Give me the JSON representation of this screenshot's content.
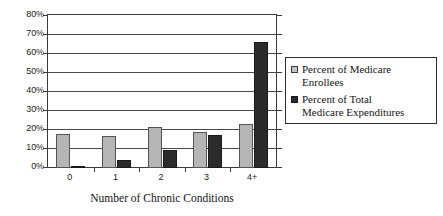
{
  "chart_data": {
    "type": "bar",
    "title": "",
    "xlabel": "Number of Chronic Conditions",
    "ylabel": "",
    "categories": [
      "0",
      "1",
      "2",
      "3",
      "4+"
    ],
    "ylim": [
      0,
      80
    ],
    "yticks": [
      "0%",
      "10%",
      "20%",
      "30%",
      "40%",
      "50%",
      "60%",
      "70%",
      "80%"
    ],
    "ytick_values": [
      0,
      10,
      20,
      30,
      40,
      50,
      60,
      70,
      80
    ],
    "grid": true,
    "legend_position": "right",
    "series": [
      {
        "name": "Percent of Medicare Enrollees",
        "color": "#b5b5b5",
        "values": [
          18,
          17,
          21.5,
          19,
          23.5
        ]
      },
      {
        "name": "Percent of Total Medicare Expenditures",
        "color": "#2b2b2b",
        "values": [
          1.3,
          4,
          9.5,
          17.5,
          66.5
        ]
      }
    ]
  },
  "legend": {
    "entries": [
      {
        "label_line1": "Percent of Medicare",
        "label_line2": "Enrollees",
        "swatch": "light-gray-square"
      },
      {
        "label_line1": "Percent of Total",
        "label_line2": "Medicare Expenditures",
        "swatch": "dark-square"
      }
    ]
  },
  "colors": {
    "series_a": "#b5b5b5",
    "series_b": "#2b2b2b",
    "axis": "#3a3a3a",
    "grid": "#4a4a4a",
    "background": "#ffffff"
  }
}
